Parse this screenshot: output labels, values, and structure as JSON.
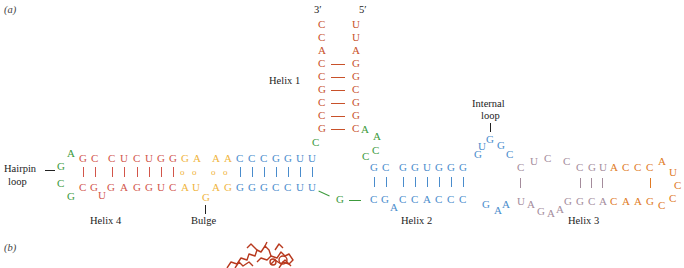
{
  "panels": {
    "a": "(a)",
    "b": "(b)"
  },
  "colors": {
    "helix1": "#c8512a",
    "helix4": "#d2554a",
    "bulge": "#f0b43c",
    "helix2": "#4a8ccc",
    "loop_green": "#3c9a3c",
    "internal_loop": "#a48c9c",
    "helix3_orange": "#e07a24",
    "structure": "#b8391e"
  },
  "labels": {
    "helix1": "Helix 1",
    "helix2": "Helix 2",
    "helix3": "Helix 3",
    "helix4": "Helix 4",
    "hairpin": "Hairpin",
    "hairpin2": "loop",
    "bulge": "Bulge",
    "internal": "Internal",
    "internal2": "loop",
    "end3": "3′",
    "end5": "5′"
  },
  "helix1": {
    "left": [
      "C",
      "C",
      "A",
      "C",
      "C",
      "G",
      "C",
      "C",
      "G"
    ],
    "right": [
      "U",
      "U",
      "A",
      "G",
      "G",
      "C",
      "G",
      "G",
      "C"
    ]
  },
  "helix4": {
    "top": [
      "G",
      "C",
      "C",
      "U",
      "C",
      "U",
      "G",
      "G"
    ],
    "bottom": [
      "C",
      "G",
      "G",
      "A",
      "G",
      "G",
      "U",
      "C"
    ],
    "bottom_bulge_U": "U"
  },
  "hairpin": {
    "letters": [
      "A",
      "G",
      "C",
      "G"
    ]
  },
  "bulge_region": {
    "top": [
      "G",
      "A",
      "A",
      "A"
    ],
    "bottom": [
      "A",
      "U",
      "A",
      "G"
    ],
    "bulge": "G"
  },
  "helix_blue_left": {
    "top": [
      "C",
      "C",
      "C",
      "G",
      "G",
      "U",
      "U"
    ],
    "bottom": [
      "G",
      "G",
      "G",
      "C",
      "C",
      "U",
      "U"
    ]
  },
  "junction": {
    "green": [
      "C",
      "A",
      "A",
      "C",
      "C",
      "G"
    ]
  },
  "helix2": {
    "top": [
      "G",
      "C",
      "G",
      "G",
      "U",
      "G",
      "G",
      "G"
    ],
    "bottom": [
      "C",
      "G",
      "C",
      "C",
      "A",
      "C",
      "C",
      "C"
    ],
    "bottom_bulge_A": "A"
  },
  "internal_loop": {
    "top": [
      "U",
      "G",
      "G",
      "C"
    ],
    "bottom": [
      "G",
      "A",
      "A"
    ]
  },
  "helix3": {
    "top_grey": [
      "C",
      "U",
      "C",
      "C",
      "C",
      "G",
      "U"
    ],
    "top_orange": [
      "A",
      "C",
      "C",
      "C",
      "A"
    ],
    "loop": [
      "U",
      "C",
      "C"
    ],
    "bottom_orange": [
      "G",
      "A",
      "A",
      "C"
    ],
    "bottom_grey": [
      "U",
      "A",
      "G",
      "A",
      "A",
      "G",
      "G",
      "C",
      "A"
    ]
  }
}
